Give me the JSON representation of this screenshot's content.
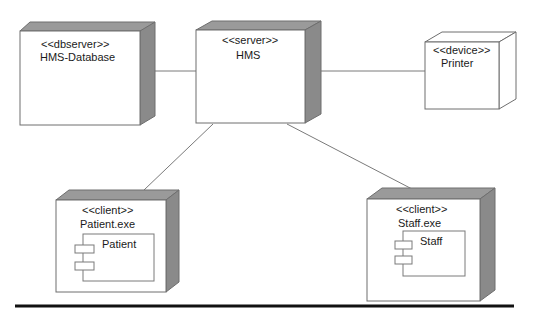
{
  "diagram": {
    "type": "UML deployment diagram",
    "nodes": [
      {
        "id": "db",
        "stereotype": "<<dbserver>>",
        "name": "HMS-Database",
        "style": "shaded"
      },
      {
        "id": "hms",
        "stereotype": "<<server>>",
        "name": "HMS",
        "style": "shaded"
      },
      {
        "id": "printer",
        "stereotype": "<<device>>",
        "name": "Printer",
        "style": "outline"
      },
      {
        "id": "patient",
        "stereotype": "<<client>>",
        "name": "Patient.exe",
        "style": "shaded",
        "component": "Patient"
      },
      {
        "id": "staff",
        "stereotype": "<<client>>",
        "name": "Staff.exe",
        "style": "shaded",
        "component": "Staff"
      }
    ],
    "connections": [
      {
        "from": "db",
        "to": "hms"
      },
      {
        "from": "hms",
        "to": "printer"
      },
      {
        "from": "hms",
        "to": "patient"
      },
      {
        "from": "hms",
        "to": "staff"
      }
    ]
  }
}
